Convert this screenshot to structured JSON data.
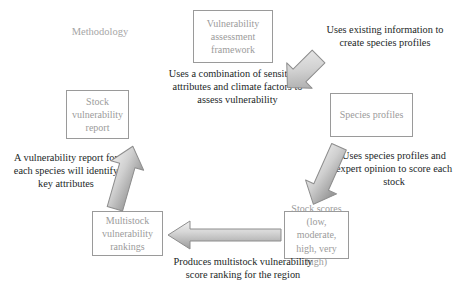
{
  "diagram": {
    "title_label": "Methodology",
    "nodes": [
      {
        "id": "vulnerability-assessment-framework",
        "text": "Vulnerability assessment framework"
      },
      {
        "id": "species-profiles",
        "text": "Species profiles"
      },
      {
        "id": "stock-scores",
        "text": "Stock scores (low, moderate, high, very high)"
      },
      {
        "id": "multistock-vulnerability-rankings",
        "text": "Multistock vulnerability rankings"
      },
      {
        "id": "stock-vulnerability-report",
        "text": "Stock vulnerability report"
      }
    ],
    "captions": [
      {
        "id": "framework-description",
        "text": "Uses a combination of sensitivity attributes and climate factors to assess vulnerability"
      },
      {
        "id": "framework-to-species",
        "text": "Uses existing information to create species profiles"
      },
      {
        "id": "species-to-scores",
        "text": "Uses species profiles and expert opinion to score each stock"
      },
      {
        "id": "scores-to-rankings",
        "text": "Produces multistock vulnerability score ranking for the region"
      },
      {
        "id": "rankings-to-report",
        "text": "A vulnerability report for each species will identify key attributes"
      }
    ],
    "arrows": [
      {
        "id": "arrow-framework-to-species",
        "direction": "down-right"
      },
      {
        "id": "arrow-species-to-scores",
        "direction": "down-left"
      },
      {
        "id": "arrow-scores-to-rankings",
        "direction": "left"
      },
      {
        "id": "arrow-rankings-to-report",
        "direction": "up-left"
      }
    ],
    "colors": {
      "box_border": "#9a9a9a",
      "box_text": "#9b9b9b",
      "caption_text": "#221f1f",
      "arrow_fill_light": "#e2e2e2",
      "arrow_fill_dark": "#9e9e9e",
      "arrow_outline": "#8d8d8d",
      "background": "#ffffff"
    }
  }
}
